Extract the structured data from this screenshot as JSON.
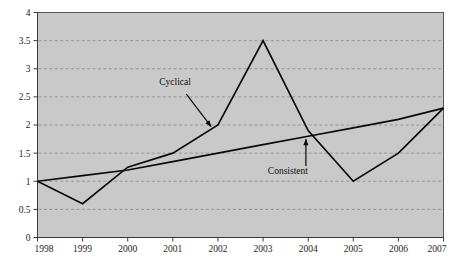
{
  "chart_data": {
    "type": "line",
    "title": "",
    "subtitle": "",
    "xlabel": "",
    "ylabel": "",
    "categories": [
      "1998",
      "1999",
      "2000",
      "2001",
      "2002",
      "2003",
      "2004",
      "2005",
      "2006",
      "2007"
    ],
    "x": [
      1998,
      1999,
      2000,
      2001,
      2002,
      2003,
      2004,
      2005,
      2006,
      2007
    ],
    "xlim": [
      1998,
      2007
    ],
    "ylim": [
      0,
      4
    ],
    "ytick_values": [
      0,
      0.5,
      1,
      1.5,
      2,
      2.5,
      3,
      3.5,
      4
    ],
    "ytick_labels": [
      "0",
      "0.5",
      "1",
      "1.5",
      "2",
      "2.5",
      "3",
      "3.5",
      "4"
    ],
    "grid": true,
    "grid_axis": "y",
    "grid_style": "dashed",
    "legend": "none",
    "plot_background": "#c9c9c9",
    "figure_background": "#ffffff",
    "line_color": "#0a0a0a",
    "series": [
      {
        "name": "Cyclical",
        "values": [
          1.0,
          0.6,
          1.25,
          1.5,
          2.0,
          3.5,
          1.9,
          1.0,
          1.5,
          2.3
        ]
      },
      {
        "name": "Consistent",
        "values": [
          1.0,
          1.1,
          1.2,
          1.35,
          1.5,
          1.65,
          1.8,
          1.95,
          2.1,
          2.3
        ]
      }
    ],
    "annotations": [
      {
        "text": "Cyclical",
        "target_series": "Cyclical",
        "label_x": 2001.05,
        "label_y": 2.72,
        "arrow_from_x": 2001.3,
        "arrow_from_y": 2.55,
        "arrow_to_x": 2001.85,
        "arrow_to_y": 1.97
      },
      {
        "text": "Consistent",
        "target_series": "Consistent",
        "label_x": 2003.55,
        "label_y": 1.13,
        "arrow_from_x": 2003.95,
        "arrow_from_y": 1.27,
        "arrow_to_x": 2003.95,
        "arrow_to_y": 1.75
      }
    ]
  }
}
